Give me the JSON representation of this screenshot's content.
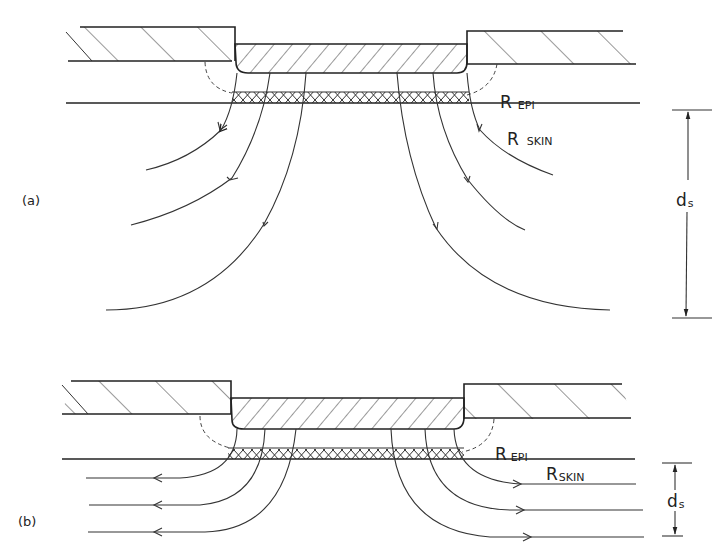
{
  "figure": {
    "panels": [
      {
        "id": "a",
        "label": "(a)",
        "r_epi": {
          "main": "R",
          "sub": "EPI"
        },
        "r_skin": {
          "main": "R",
          "sub": "SKIN"
        },
        "dimension": {
          "main": "d",
          "sub": "s"
        },
        "flow_direction": "downward-spreading"
      },
      {
        "id": "b",
        "label": "(b)",
        "r_epi": {
          "main": "R",
          "sub": "EPI"
        },
        "r_skin": {
          "main": "R",
          "sub": "SKIN"
        },
        "dimension": {
          "main": "d",
          "sub": "s"
        },
        "flow_direction": "lateral"
      }
    ]
  }
}
